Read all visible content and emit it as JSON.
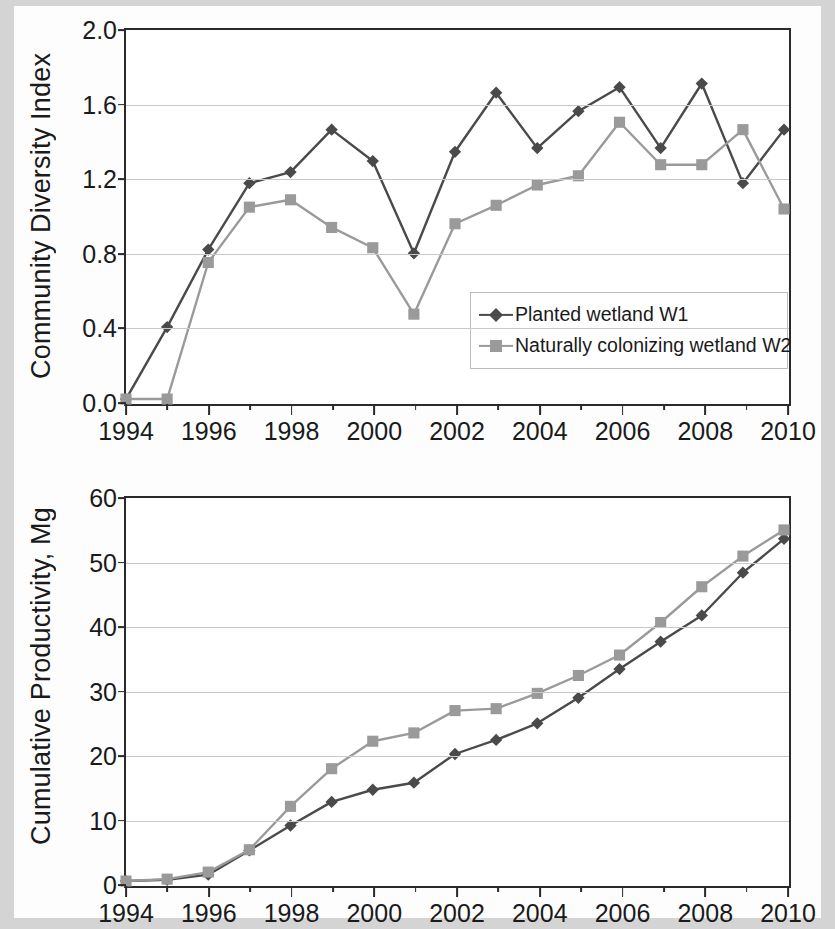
{
  "figure": {
    "background_color": "#d4d4d4",
    "panel_background": "#ffffff"
  },
  "series_colors": {
    "w1": "#4a4a4a",
    "w2": "#9a9a9a",
    "axis": "#2a2a2a",
    "gridline": "#c9c9c9"
  },
  "legend": {
    "entries": [
      {
        "label": "Planted wetland W1",
        "marker": "diamond",
        "color": "#4a4a4a"
      },
      {
        "label": "Naturally colonizing wetland W2",
        "marker": "square",
        "color": "#9a9a9a"
      }
    ]
  },
  "chart_data": [
    {
      "type": "line",
      "panel": "top",
      "title": "",
      "xlabel": "",
      "ylabel": "Community Diversity Index",
      "x": [
        1994,
        1995,
        1996,
        1997,
        1998,
        1999,
        2000,
        2001,
        2002,
        2003,
        2004,
        2005,
        2006,
        2007,
        2008,
        2009,
        2010
      ],
      "xlim": [
        1994,
        2010
      ],
      "ylim": [
        0.0,
        2.0
      ],
      "xticks": [
        1994,
        1996,
        1998,
        2000,
        2002,
        2004,
        2006,
        2008,
        2010
      ],
      "xticklabels": [
        "1994",
        "1996",
        "1998",
        "2000",
        "2002",
        "2004",
        "2006",
        "2008",
        "2010"
      ],
      "yticks": [
        0.0,
        0.4,
        0.8,
        1.2,
        1.6,
        2.0
      ],
      "yticklabels": [
        "0.0",
        "0.4",
        "0.8",
        "1.2",
        "1.6",
        "2.0"
      ],
      "grid": true,
      "legend_position": "center-right",
      "series": [
        {
          "name": "Planted wetland W1",
          "marker": "diamond",
          "color": "#4a4a4a",
          "values": [
            0.0,
            0.39,
            0.81,
            1.17,
            1.23,
            1.46,
            1.29,
            0.79,
            1.34,
            1.66,
            1.36,
            1.56,
            1.69,
            1.36,
            1.71,
            1.17,
            1.46
          ]
        },
        {
          "name": "Naturally colonizing wetland W2",
          "marker": "square",
          "color": "#9a9a9a",
          "values": [
            0.0,
            0.0,
            0.74,
            1.04,
            1.08,
            0.93,
            0.82,
            0.46,
            0.95,
            1.05,
            1.16,
            1.21,
            1.5,
            1.27,
            1.27,
            1.46,
            1.03
          ]
        }
      ]
    },
    {
      "type": "line",
      "panel": "bottom",
      "title": "",
      "xlabel": "",
      "ylabel": "Cumulative Productivity, Mg",
      "x": [
        1994,
        1995,
        1996,
        1997,
        1998,
        1999,
        2000,
        2001,
        2002,
        2003,
        2004,
        2005,
        2006,
        2007,
        2008,
        2009,
        2010
      ],
      "xlim": [
        1994,
        2010
      ],
      "ylim": [
        0,
        60
      ],
      "xticks": [
        1994,
        1996,
        1998,
        2000,
        2002,
        2004,
        2006,
        2008,
        2010
      ],
      "xticklabels": [
        "1994",
        "1996",
        "1998",
        "2000",
        "2002",
        "2004",
        "2006",
        "2008",
        "2010"
      ],
      "yticks": [
        0,
        10,
        20,
        30,
        40,
        50,
        60
      ],
      "yticklabels": [
        "0",
        "10",
        "20",
        "30",
        "40",
        "50",
        "60"
      ],
      "grid": true,
      "legend_position": "none",
      "series": [
        {
          "name": "Planted wetland W1",
          "marker": "diamond",
          "color": "#4a4a4a",
          "values": [
            0.0,
            0.2,
            1.0,
            4.8,
            8.7,
            12.4,
            14.3,
            15.4,
            19.9,
            22.1,
            24.7,
            28.7,
            33.2,
            37.5,
            41.6,
            48.3,
            53.6
          ]
        },
        {
          "name": "Naturally colonizing wetland W2",
          "marker": "square",
          "color": "#9a9a9a",
          "values": [
            0.0,
            0.3,
            1.4,
            4.9,
            11.7,
            17.6,
            21.9,
            23.2,
            26.7,
            27.0,
            29.4,
            32.2,
            35.4,
            40.5,
            46.1,
            50.9,
            55.0
          ]
        }
      ]
    }
  ]
}
